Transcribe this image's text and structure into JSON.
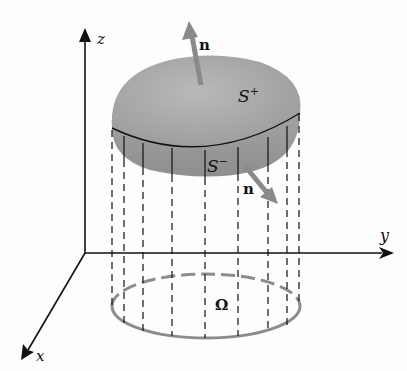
{
  "figure": {
    "axes": {
      "x_label": "x",
      "y_label": "y",
      "z_label": "z"
    },
    "surface": {
      "upper_label": "S",
      "upper_sup": "+",
      "lower_label": "S",
      "lower_sup": "−"
    },
    "normals": {
      "upper_label": "n",
      "lower_label": "n"
    },
    "region": {
      "label": "Ω"
    },
    "colors": {
      "surface_fill": "#a9a9a9",
      "surface_shadow": "#8f8f8f",
      "normal_arrow": "#8a8a8a",
      "region_outline": "#8c8c8c",
      "axis": "#111111"
    }
  }
}
